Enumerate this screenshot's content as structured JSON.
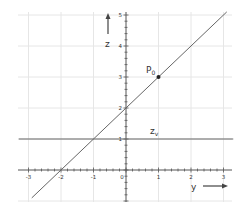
{
  "chart_data": {
    "type": "line",
    "title": "",
    "xlabel": "y",
    "ylabel": "z",
    "xlim": [
      -3.1,
      3.2
    ],
    "ylim": [
      -1.0,
      5.2
    ],
    "grid": true,
    "x_ticks": [
      -3,
      -2,
      -1,
      0,
      1,
      2,
      3
    ],
    "y_ticks": [
      1,
      2,
      3,
      4,
      5
    ],
    "x_tick_labels": [
      "-3",
      "-2",
      "-1",
      "0",
      "1",
      "2",
      "3"
    ],
    "y_tick_labels": [
      "1",
      "2",
      "3",
      "4",
      "5"
    ],
    "series": [
      {
        "name": "z = y + 2",
        "kind": "line",
        "points": [
          [
            -2.9,
            -0.9
          ],
          [
            3.1,
            5.1
          ]
        ]
      },
      {
        "name": "z_v",
        "kind": "horizontal",
        "z": 1,
        "points": [
          [
            -3.3,
            1
          ],
          [
            3.3,
            1
          ]
        ]
      }
    ],
    "annotations": [
      {
        "label": "P",
        "subscript": "0",
        "x": 1,
        "y": 3,
        "marker": "dot"
      },
      {
        "label": "z",
        "subscript": "v",
        "x": 0.75,
        "y": 1.15
      }
    ],
    "axis_arrows": {
      "z_label": "z",
      "y_label": "y"
    }
  },
  "labels": {
    "z_axis": "z",
    "y_axis": "y",
    "point": "P",
    "point_sub": "0",
    "zv": "z",
    "zv_sub": "v",
    "tick_x": [
      "-3",
      "-2",
      "-1",
      "0",
      "1",
      "2",
      "3"
    ],
    "tick_y": [
      "1",
      "2",
      "3",
      "4",
      "5"
    ]
  },
  "colors": {
    "grid": "#e6e6e6",
    "axis": "#555555",
    "line": "#666666",
    "point": "#222222"
  }
}
